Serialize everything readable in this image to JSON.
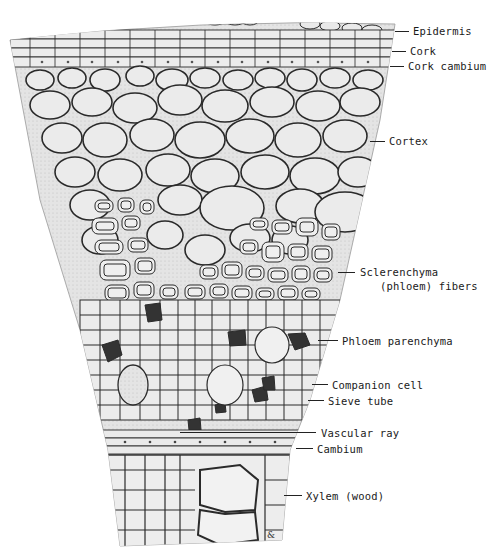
{
  "diagram": {
    "type": "plant stem cross-section (woody stem wedge)",
    "colors": {
      "background": "#ffffff",
      "tissue_fill": "#e6e6e6",
      "cell_wall": "#2a2a2a",
      "dark_cells": "#333333",
      "label_text": "#1a1a1a"
    },
    "labels": [
      {
        "id": "epidermis",
        "text": "Epidermis",
        "x": 413,
        "y": 25,
        "line_x1": 395,
        "line_x2": 409
      },
      {
        "id": "cork",
        "text": "Cork",
        "x": 410,
        "y": 45,
        "line_x1": 392,
        "line_x2": 406
      },
      {
        "id": "cork-cambium",
        "text": "Cork cambium",
        "x": 408,
        "y": 60,
        "line_x1": 390,
        "line_x2": 404
      },
      {
        "id": "cortex",
        "text": "Cortex",
        "x": 389,
        "y": 135,
        "line_x1": 370,
        "line_x2": 385
      },
      {
        "id": "sclerenchyma",
        "text": "Sclerenchyma",
        "x": 360,
        "y": 266,
        "line_x1": 338,
        "line_x2": 355
      },
      {
        "id": "sclerenchyma-2",
        "text": "(phloem) fibers",
        "x": 380,
        "y": 280,
        "line_x1": null,
        "line_x2": null
      },
      {
        "id": "phloem-parenchyma",
        "text": "Phloem parenchyma",
        "x": 342,
        "y": 335,
        "line_x1": 318,
        "line_x2": 338
      },
      {
        "id": "companion-cell",
        "text": "Companion cell",
        "x": 332,
        "y": 379,
        "line_x1": 312,
        "line_x2": 328
      },
      {
        "id": "sieve-tube",
        "text": "Sieve tube",
        "x": 328,
        "y": 395,
        "line_x1": 308,
        "line_x2": 324
      },
      {
        "id": "vascular-ray",
        "text": "Vascular ray",
        "x": 321,
        "y": 427,
        "line_x1": 180,
        "line_x2": 316
      },
      {
        "id": "cambium",
        "text": "Cambium",
        "x": 317,
        "y": 443,
        "line_x1": 296,
        "line_x2": 313
      },
      {
        "id": "xylem",
        "text": "Xylem (wood)",
        "x": 306,
        "y": 490,
        "line_x1": 284,
        "line_x2": 302
      }
    ],
    "signature": "&"
  }
}
